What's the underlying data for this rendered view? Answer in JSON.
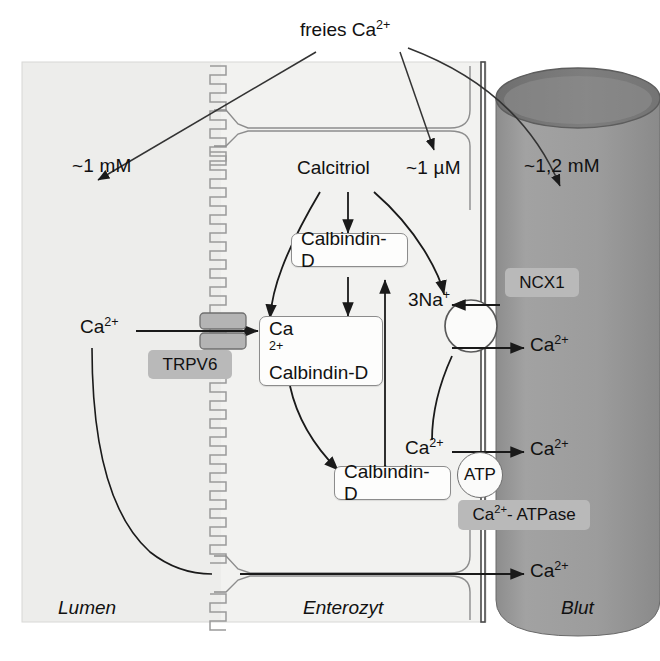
{
  "figure": {
    "language": "de",
    "background_color": "#ffffff"
  },
  "colors": {
    "lumen_bg": "#eeeeec",
    "enterocyte_bg": "#f1f1ef",
    "blood_fill": "#9a9a9a",
    "blood_top_fill": "#7d7d7d",
    "tag_gray": "#b9b9b9",
    "membrane_gray": "#9b9b9b",
    "line": "#1a1a1a",
    "box_border": "#8c8c8c"
  },
  "top": {
    "free_calcium_label": "freies Ca2+",
    "free_calcium_base": "freies Ca",
    "free_calcium_sup": "2+"
  },
  "concentrations": [
    {
      "name": "lumen-concentration",
      "value": "~1 mM"
    },
    {
      "name": "enterocyte-concentration",
      "value": "~1 µM"
    },
    {
      "name": "blood-concentration",
      "value": "~1,2 mM"
    }
  ],
  "compartments": [
    {
      "name": "lumen",
      "label": "Lumen"
    },
    {
      "name": "enterocyte",
      "label": "Enterozyt"
    },
    {
      "name": "blood",
      "label": "Blut"
    }
  ],
  "nodes": {
    "calcitriol": "Calcitriol",
    "calbindin_top": "Calbindin-D",
    "calbindin_bottom": "Calbindin-D",
    "ca_calbindin_line1_base": "Ca",
    "ca_calbindin_line1_sup": "2+",
    "ca_calbindin_line2": "Calbindin-D"
  },
  "transporters": [
    {
      "name": "trpv6",
      "label": "TRPV6"
    },
    {
      "name": "ncx1",
      "label": "NCX1"
    },
    {
      "name": "ca-atpase",
      "label": "Ca2+- ATPase",
      "base": "Ca",
      "sup": "2+",
      "tail": "- ATPase"
    },
    {
      "name": "atp",
      "label": "ATP"
    }
  ],
  "ions": {
    "lumen_ca_base": "Ca",
    "lumen_ca_sup": "2+",
    "sodium_base": "3Na",
    "sodium_sup": "+",
    "blood_ca_ncx_base": "Ca",
    "blood_ca_ncx_sup": "2+",
    "cyto_ca_base": "Ca",
    "cyto_ca_sup": "2+",
    "blood_ca_atpase_base": "Ca",
    "blood_ca_atpase_sup": "2+",
    "blood_ca_para_base": "Ca",
    "blood_ca_para_sup": "2+"
  }
}
